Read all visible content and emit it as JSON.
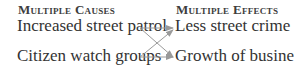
{
  "causes": {
    "heading": "Multiple Causes",
    "items": [
      "Increased street patrol",
      "Citizen watch groups"
    ]
  },
  "effects": {
    "heading": "Multiple Effects",
    "items": [
      "Less street crime",
      "Growth of business"
    ]
  },
  "arrow_color": "#9a9a9a"
}
